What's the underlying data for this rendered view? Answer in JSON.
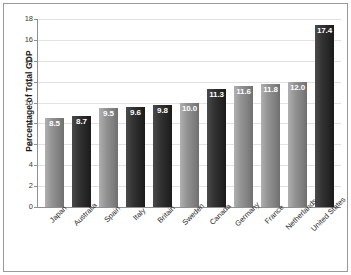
{
  "chart_data": {
    "type": "bar",
    "title": "",
    "subtitle": "",
    "xlabel": "",
    "ylabel": "Percentage of Total GDP",
    "ylim": [
      0,
      18
    ],
    "ytick_step": 2,
    "yticks": [
      "18",
      "16",
      "14",
      "12",
      "10",
      "8",
      "6",
      "4",
      "2",
      "0"
    ],
    "grid": true,
    "legend": "none",
    "categories": [
      "Japan",
      "Australia",
      "Spain",
      "Italy",
      "Britain",
      "Sweden",
      "Canada",
      "Germany",
      "France",
      "Netherlands",
      "United States"
    ],
    "values": [
      8.5,
      8.7,
      9.5,
      9.6,
      9.8,
      10.0,
      11.3,
      11.6,
      11.8,
      12.0,
      17.4
    ],
    "value_labels": [
      "8.5",
      "8.7",
      "9.5",
      "9.6",
      "9.8",
      "10.0",
      "11.3",
      "11.6",
      "11.8",
      "12.0",
      "17.4"
    ],
    "bar_shades": [
      "light",
      "dark",
      "light",
      "dark",
      "dark",
      "light",
      "dark",
      "light",
      "light",
      "light",
      "dark"
    ],
    "colors": {
      "bar_light": "#949494",
      "bar_dark": "#2b2b2b",
      "gridline": "#e2e2e2",
      "axis": "#8f8f8f",
      "value_label": "#ffffff",
      "text": "#2a2a2a",
      "frame": "#9a9a9a",
      "background": "#ffffff"
    }
  }
}
